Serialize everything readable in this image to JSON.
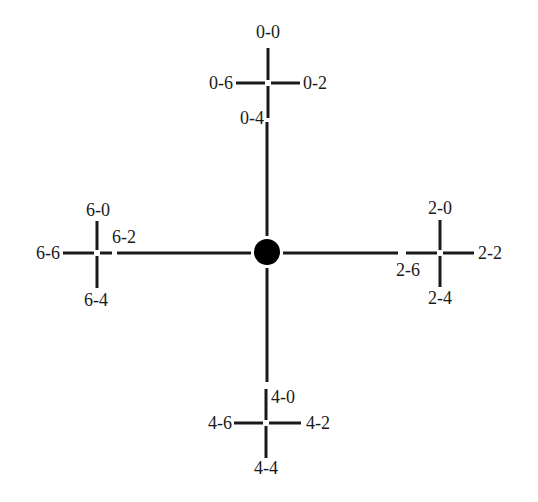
{
  "diagram": {
    "type": "tree",
    "center_node": {
      "shape": "filled-circle",
      "color": "#000000"
    },
    "line_color": "#1a1a1a",
    "branches": {
      "top": {
        "id": "0",
        "labels": {
          "up": "0-0",
          "right": "0-2",
          "down": "0-4",
          "left": "0-6"
        }
      },
      "right": {
        "id": "2",
        "labels": {
          "up": "2-0",
          "right": "2-2",
          "down": "2-4",
          "left": "2-6"
        }
      },
      "bottom": {
        "id": "4",
        "labels": {
          "up": "4-0",
          "right": "4-2",
          "down": "4-4",
          "left": "4-6"
        }
      },
      "left": {
        "id": "6",
        "labels": {
          "up": "6-0",
          "right": "6-2",
          "down": "6-4",
          "left": "6-6"
        }
      }
    }
  }
}
